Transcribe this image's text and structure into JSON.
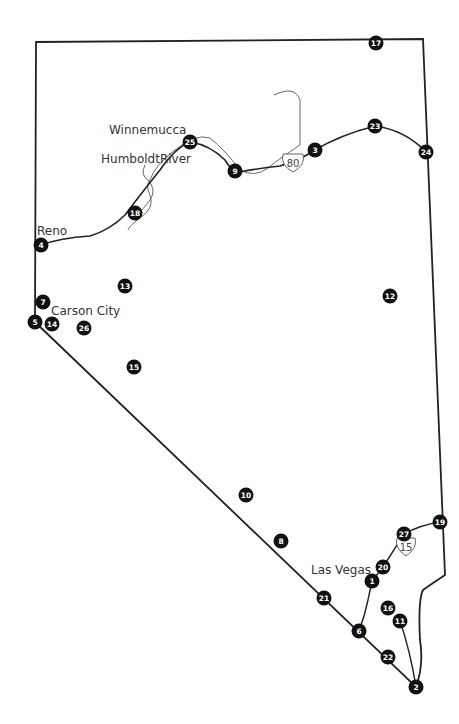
{
  "map": {
    "title": "Nevada",
    "colors": {
      "border": "#222222",
      "marker": "#111111",
      "marker_text": "#ffffff",
      "river": "#444444",
      "background": "#ffffff"
    },
    "places": [
      {
        "label": "Winnemucca",
        "x": 109,
        "y": 134
      },
      {
        "label": "HumboldtRiver",
        "x": 101,
        "y": 163
      },
      {
        "label": "Reno",
        "x": 37,
        "y": 235
      },
      {
        "label": "Carson City",
        "x": 51,
        "y": 315
      },
      {
        "label": "Las Vegas",
        "x": 311,
        "y": 574
      }
    ],
    "highways": [
      {
        "label": "80",
        "x": 293,
        "y": 163
      },
      {
        "label": "15",
        "x": 406,
        "y": 541
      }
    ],
    "markers": [
      {
        "id": "1",
        "x": 372,
        "y": 581
      },
      {
        "id": "2",
        "x": 416,
        "y": 687
      },
      {
        "id": "3",
        "x": 315,
        "y": 150
      },
      {
        "id": "4",
        "x": 41,
        "y": 245
      },
      {
        "id": "5",
        "x": 35,
        "y": 322
      },
      {
        "id": "6",
        "x": 359,
        "y": 631
      },
      {
        "id": "7",
        "x": 43,
        "y": 302
      },
      {
        "id": "8",
        "x": 281,
        "y": 541
      },
      {
        "id": "9",
        "x": 235,
        "y": 171
      },
      {
        "id": "10",
        "x": 246,
        "y": 495
      },
      {
        "id": "11",
        "x": 400,
        "y": 621
      },
      {
        "id": "12",
        "x": 390,
        "y": 296
      },
      {
        "id": "13",
        "x": 125,
        "y": 286
      },
      {
        "id": "14",
        "x": 52,
        "y": 324
      },
      {
        "id": "15",
        "x": 134,
        "y": 367
      },
      {
        "id": "16",
        "x": 388,
        "y": 608
      },
      {
        "id": "17",
        "x": 376,
        "y": 43
      },
      {
        "id": "18",
        "x": 135,
        "y": 213
      },
      {
        "id": "19",
        "x": 440,
        "y": 522
      },
      {
        "id": "20",
        "x": 383,
        "y": 567
      },
      {
        "id": "21",
        "x": 324,
        "y": 598
      },
      {
        "id": "22",
        "x": 388,
        "y": 657
      },
      {
        "id": "23",
        "x": 375,
        "y": 126
      },
      {
        "id": "24",
        "x": 426,
        "y": 152
      },
      {
        "id": "25",
        "x": 190,
        "y": 142
      },
      {
        "id": "26",
        "x": 84,
        "y": 328
      },
      {
        "id": "27",
        "x": 404,
        "y": 534
      }
    ]
  }
}
